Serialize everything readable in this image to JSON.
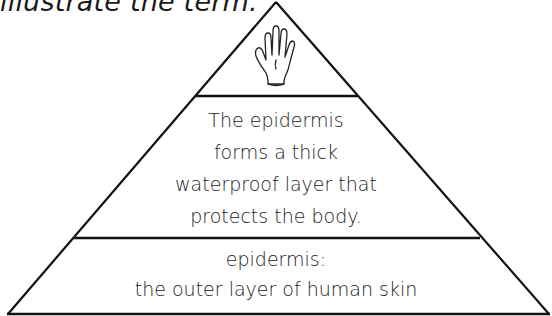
{
  "instruction": {
    "text": "illustrate the term."
  },
  "pyramid": {
    "top_tier": {
      "icon": "hand-icon"
    },
    "middle_tier": {
      "lines": [
        "The epidermis",
        "forms a thick",
        "waterproof layer that",
        "protects the body."
      ]
    },
    "bottom_tier": {
      "lines": [
        "epidermis:",
        "the outer layer of human skin"
      ]
    }
  }
}
